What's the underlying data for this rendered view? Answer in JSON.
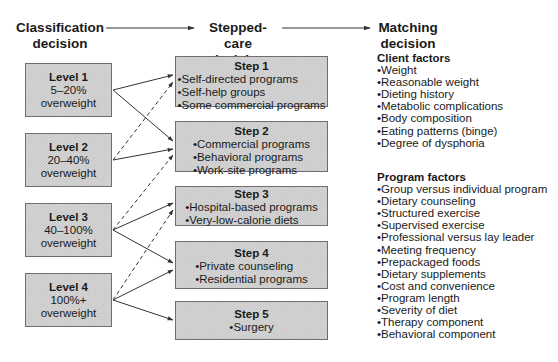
{
  "headers": {
    "classification": [
      "Classification",
      "decision"
    ],
    "stepped_care": [
      "Stepped-care",
      "decision"
    ],
    "matching": [
      "Matching",
      "decision"
    ]
  },
  "levels": [
    {
      "title": "Level 1",
      "range": "5–20%",
      "desc": "overweight"
    },
    {
      "title": "Level 2",
      "range": "20–40%",
      "desc": "overweight"
    },
    {
      "title": "Level 3",
      "range": "40–100%",
      "desc": "overweight"
    },
    {
      "title": "Level 4",
      "range": "100%+",
      "desc": "overweight"
    }
  ],
  "steps": [
    {
      "title": "Step 1",
      "items": [
        "Self-directed programs",
        "Self-help groups",
        "Some commercial programs"
      ]
    },
    {
      "title": "Step 2",
      "items": [
        "Commercial programs",
        "Behavioral programs",
        "Work-site programs"
      ]
    },
    {
      "title": "Step 3",
      "items": [
        "Hospital-based programs",
        "Very-low-calorie diets"
      ]
    },
    {
      "title": "Step 4",
      "items": [
        "Private counseling",
        "Residential programs"
      ]
    },
    {
      "title": "Step 5",
      "items": [
        "Surgery"
      ]
    }
  ],
  "client_factors": {
    "title": "Client factors",
    "items": [
      "Weight",
      "Reasonable weight",
      "Dieting history",
      "Metabolic complications",
      "Body composition",
      "Eating patterns (binge)",
      "Degree of dysphoria"
    ]
  },
  "program_factors": {
    "title": "Program factors",
    "items": [
      "Group versus individual program",
      "Dietary counseling",
      "Structured exercise",
      "Supervised exercise",
      "Professional versus lay leader",
      "Meeting frequency",
      "Prepackaged foods",
      "Dietary supplements",
      "Cost and convenience",
      "Program length",
      "Severity of diet",
      "Therapy component",
      "Behavioral component"
    ]
  },
  "connections": [
    {
      "from": "Level 1",
      "to": "Step 1",
      "style": "solid"
    },
    {
      "from": "Level 1",
      "to": "Step 2",
      "style": "solid"
    },
    {
      "from": "Level 2",
      "to": "Step 1",
      "style": "dashed"
    },
    {
      "from": "Level 2",
      "to": "Step 2",
      "style": "solid"
    },
    {
      "from": "Level 3",
      "to": "Step 2",
      "style": "dashed"
    },
    {
      "from": "Level 3",
      "to": "Step 3",
      "style": "solid"
    },
    {
      "from": "Level 3",
      "to": "Step 4",
      "style": "solid"
    },
    {
      "from": "Level 4",
      "to": "Step 3",
      "style": "dashed"
    },
    {
      "from": "Level 4",
      "to": "Step 4",
      "style": "solid"
    },
    {
      "from": "Level 4",
      "to": "Step 5",
      "style": "solid"
    }
  ]
}
